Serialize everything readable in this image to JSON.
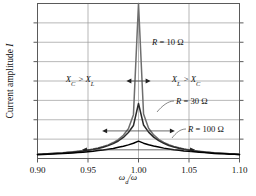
{
  "figure": {
    "kind": "resonance-curve-plot",
    "background": "#ffffff",
    "frame_color": "#5a5a5a",
    "grid_color": "#9a9a9a"
  },
  "axes": {
    "x": {
      "label_main": "ω",
      "label_sub": "d",
      "label_tail": "/ω",
      "ticks": [
        "0.90",
        "0.95",
        "1.00",
        "1.05",
        "1.10"
      ],
      "values": [
        0.9,
        0.95,
        1.0,
        1.05,
        1.1
      ],
      "min": 0.9,
      "max": 1.1
    },
    "y": {
      "label_text": "Current amplitude ",
      "label_symbol": "I",
      "min": 0,
      "max": 1.0,
      "tick_count": 8,
      "tick_labels": []
    }
  },
  "annotations": {
    "left_region": {
      "a": "X",
      "a_sub": "C",
      "op": " > ",
      "b": "X",
      "b_sub": "L"
    },
    "right_region": {
      "a": "X",
      "a_sub": "L",
      "op": " > ",
      "b": "X",
      "b_sub": "C"
    },
    "curve_labels": [
      {
        "id": "r10",
        "text": "R = 10 Ω",
        "x": 152,
        "y": 45
      },
      {
        "id": "r30",
        "text": "R = 30 Ω",
        "x": 176,
        "y": 104
      },
      {
        "id": "r100",
        "text": "R = 100 Ω",
        "x": 188,
        "y": 132
      }
    ]
  },
  "chart_data": {
    "type": "line",
    "title": "",
    "xlabel": "ω_d/ω",
    "ylabel": "Current amplitude I",
    "xlim": [
      0.9,
      1.1
    ],
    "ylim": [
      0,
      1.0
    ],
    "grid": true,
    "legend": "inline-labels",
    "x": [
      0.9,
      0.905,
      0.91,
      0.915,
      0.92,
      0.925,
      0.93,
      0.935,
      0.94,
      0.945,
      0.95,
      0.955,
      0.96,
      0.965,
      0.97,
      0.975,
      0.98,
      0.985,
      0.99,
      0.995,
      1.0,
      1.005,
      1.01,
      1.015,
      1.02,
      1.025,
      1.03,
      1.035,
      1.04,
      1.045,
      1.05,
      1.055,
      1.06,
      1.065,
      1.07,
      1.075,
      1.08,
      1.085,
      1.09,
      1.095,
      1.1
    ],
    "series": [
      {
        "name": "R = 10 Ω",
        "resistance_ohm": 10,
        "color": "#6e6e6e",
        "peak_value": 1.0,
        "half_width": 0.012,
        "values": [
          0.028,
          0.029,
          0.031,
          0.033,
          0.035,
          0.037,
          0.04,
          0.043,
          0.046,
          0.05,
          0.055,
          0.061,
          0.068,
          0.077,
          0.088,
          0.103,
          0.122,
          0.15,
          0.192,
          0.283,
          1.0,
          0.287,
          0.195,
          0.152,
          0.124,
          0.104,
          0.089,
          0.078,
          0.069,
          0.062,
          0.056,
          0.051,
          0.046,
          0.043,
          0.04,
          0.037,
          0.035,
          0.033,
          0.031,
          0.029,
          0.028
        ]
      },
      {
        "name": "R = 30 Ω",
        "resistance_ohm": 30,
        "color": "#2b2b2b",
        "peak_value": 0.355,
        "half_width": 0.036,
        "values": [
          0.027,
          0.029,
          0.03,
          0.032,
          0.034,
          0.036,
          0.039,
          0.041,
          0.045,
          0.048,
          0.053,
          0.058,
          0.065,
          0.073,
          0.083,
          0.096,
          0.113,
          0.136,
          0.168,
          0.213,
          0.355,
          0.216,
          0.17,
          0.138,
          0.115,
          0.098,
          0.084,
          0.074,
          0.066,
          0.059,
          0.054,
          0.049,
          0.045,
          0.041,
          0.039,
          0.036,
          0.034,
          0.032,
          0.03,
          0.029,
          0.027
        ]
      },
      {
        "name": "R = 100 Ω",
        "resistance_ohm": 100,
        "color": "#000000",
        "peak_value": 0.112,
        "half_width": 0.112,
        "values": [
          0.025,
          0.026,
          0.028,
          0.029,
          0.031,
          0.032,
          0.034,
          0.036,
          0.038,
          0.041,
          0.044,
          0.047,
          0.051,
          0.055,
          0.06,
          0.065,
          0.072,
          0.079,
          0.088,
          0.098,
          0.112,
          0.099,
          0.089,
          0.081,
          0.074,
          0.067,
          0.062,
          0.057,
          0.053,
          0.049,
          0.046,
          0.043,
          0.04,
          0.038,
          0.035,
          0.033,
          0.031,
          0.03,
          0.028,
          0.027,
          0.025
        ]
      }
    ],
    "bandwidth_arrows": [
      {
        "for": "R = 10 Ω",
        "y_level": 0.5,
        "x_left": 0.988,
        "x_right": 1.012
      },
      {
        "for": "R = 30 Ω",
        "y_level": 0.178,
        "x_left": 0.964,
        "x_right": 1.036
      },
      {
        "for": "R = 100 Ω",
        "y_level": 0.056,
        "x_left": 0.944,
        "x_right": 1.056
      }
    ]
  }
}
